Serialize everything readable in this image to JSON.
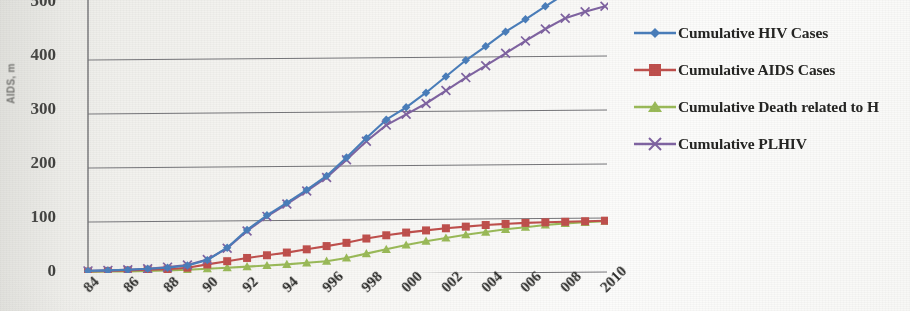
{
  "chart_data": {
    "type": "line",
    "title": "",
    "subtitle": "",
    "xlabel": "",
    "ylabel": "AIDS, m",
    "ylim": [
      0,
      500
    ],
    "yticks": [
      0,
      100,
      200,
      300,
      400,
      500
    ],
    "grid": "horizontal",
    "legend_position": "right",
    "note": "Scanned/photographed chart; y-axis title and the top '500' tick are clipped at the image edge, year labels are rotated and clipped at the bottom, and the third legend entry is cut off at the right edge.",
    "x": [
      1984,
      1985,
      1986,
      1987,
      1988,
      1989,
      1990,
      1991,
      1992,
      1993,
      1994,
      1995,
      1996,
      1997,
      1998,
      1999,
      2000,
      2001,
      2002,
      2003,
      2004,
      2005,
      2006,
      2007,
      2008,
      2009,
      2010
    ],
    "xtick_labels": [
      "1984",
      "1986",
      "1988",
      "1990",
      "1992",
      "1994",
      "1996",
      "1998",
      "2000",
      "2002",
      "2004",
      "2006",
      "2008",
      "2010"
    ],
    "xtick_labels_visible": [
      "84",
      "86",
      "88",
      "90",
      "92",
      "94",
      "996",
      "998",
      "000",
      "002",
      "004",
      "006",
      "008",
      "2010"
    ],
    "series": [
      {
        "name": "Cumulative HIV Cases",
        "color": "#4a7ebb",
        "marker": "diamond",
        "values": [
          2,
          3,
          4,
          6,
          8,
          12,
          22,
          45,
          78,
          105,
          128,
          152,
          178,
          212,
          248,
          282,
          305,
          332,
          362,
          392,
          418,
          445,
          468,
          492,
          515,
          538,
          560
        ]
      },
      {
        "name": "Cumulative AIDS Cases",
        "color": "#c0504d",
        "marker": "square",
        "values": [
          1,
          2,
          3,
          4,
          5,
          8,
          14,
          20,
          26,
          31,
          36,
          42,
          48,
          54,
          62,
          68,
          73,
          77,
          81,
          84,
          87,
          89,
          91,
          92,
          93,
          94,
          95
        ]
      },
      {
        "name": "Cumulative Death related to H",
        "color": "#9bbb59",
        "marker": "triangle",
        "values": [
          0,
          1,
          1,
          2,
          3,
          4,
          6,
          8,
          10,
          12,
          14,
          17,
          20,
          26,
          34,
          42,
          50,
          57,
          63,
          69,
          74,
          79,
          83,
          87,
          90,
          92,
          94
        ]
      },
      {
        "name": "Cumulative PLHIV",
        "color": "#8064a2",
        "marker": "x",
        "values": [
          2,
          3,
          4,
          6,
          9,
          13,
          23,
          44,
          76,
          103,
          126,
          150,
          175,
          208,
          242,
          272,
          292,
          312,
          336,
          360,
          382,
          405,
          428,
          450,
          470,
          482,
          492
        ]
      }
    ]
  },
  "axis": {
    "y_title": "AIDS, m",
    "y_ticks": [
      "500",
      "400",
      "300",
      "200",
      "100",
      "0"
    ]
  },
  "legend": {
    "items": [
      {
        "label": "Cumulative HIV Cases",
        "color": "#4a7ebb",
        "marker": "diamond"
      },
      {
        "label": "Cumulative AIDS Cases",
        "color": "#c0504d",
        "marker": "square"
      },
      {
        "label": "Cumulative Death related to H",
        "color": "#9bbb59",
        "marker": "triangle"
      },
      {
        "label": "Cumulative PLHIV",
        "color": "#8064a2",
        "marker": "x"
      }
    ]
  }
}
